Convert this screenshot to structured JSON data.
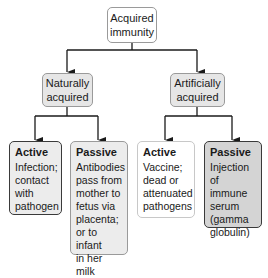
{
  "diagram": {
    "title": "Acquired immunity",
    "root": {
      "label": "Acquired immunity"
    },
    "branches": [
      {
        "label": "Naturally acquired",
        "children": [
          {
            "title": "Active",
            "text": "Infection;\ncontact\nwith\npathogen"
          },
          {
            "title": "Passive",
            "text": "Antibodies\npass from\nmother to\nfetus via\nplacenta;\nor to infant\nin her milk"
          }
        ]
      },
      {
        "label": "Artificially acquired",
        "children": [
          {
            "title": "Active",
            "text": "Vaccine;\ndead or\nattenuated\npathogens"
          },
          {
            "title": "Passive",
            "text": "Injection\nof immune\nserum\n(gamma\nglobulin)"
          }
        ]
      }
    ],
    "colors": {
      "line": "#1a1a1a",
      "box_fill_gray": "#e6e6e6",
      "box_fill_dark": "#d4d4d4",
      "border_dark": "#3a3a3a",
      "border_light": "#9a9a9a"
    }
  }
}
